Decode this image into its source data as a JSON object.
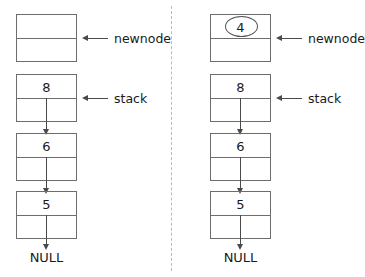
{
  "diagram": {
    "style": {
      "background": "#ffffff",
      "box_stroke": "#6d6d6d",
      "arrow_color": "#4a4a4a",
      "text_color": "#1a1a1a",
      "divider_color": "#b9b9b9"
    },
    "panels": [
      {
        "id": "before",
        "newnode": {
          "label": "newnode",
          "value": "",
          "has_ellipse": false
        },
        "stack_label": "stack",
        "nodes": [
          {
            "value": "8"
          },
          {
            "value": "6"
          },
          {
            "value": "5"
          }
        ],
        "terminator": "NULL"
      },
      {
        "id": "after",
        "newnode": {
          "label": "newnode",
          "value": "4",
          "has_ellipse": true
        },
        "stack_label": "stack",
        "nodes": [
          {
            "value": "8"
          },
          {
            "value": "6"
          },
          {
            "value": "5"
          }
        ],
        "terminator": "NULL"
      }
    ]
  }
}
